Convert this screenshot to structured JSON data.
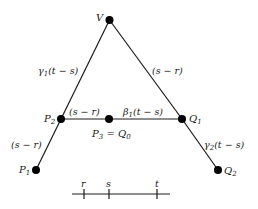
{
  "diagram": {
    "type": "graph",
    "nodes": {
      "V": {
        "label": "V",
        "x": 109.5,
        "y": 20
      },
      "P2": {
        "label": "P",
        "sub": "2",
        "x": 61,
        "y": 119
      },
      "P3": {
        "label": "P",
        "sub": "3",
        "x": 109,
        "y": 119
      },
      "Q1": {
        "label": "Q",
        "sub": "1",
        "x": 182,
        "y": 119
      },
      "P1": {
        "label": "P",
        "sub": "1",
        "x": 36,
        "y": 170
      },
      "Q2": {
        "label": "Q",
        "sub": "2",
        "x": 218,
        "y": 170
      }
    },
    "p3_label": {
      "left": "P",
      "left_sub": "3",
      "eq": " = ",
      "right": "Q",
      "right_sub": "0"
    },
    "edges": [
      {
        "from": "V",
        "to": "P2",
        "label": "γ",
        "label_sub": "1",
        "label_arg": "(t − s)"
      },
      {
        "from": "V",
        "to": "Q1",
        "label": "(s − r)"
      },
      {
        "from": "P2",
        "to": "P3",
        "label": "(s − r)"
      },
      {
        "from": "P3",
        "to": "Q1",
        "label": "β",
        "label_sub": "1",
        "label_arg": "(t − s)"
      },
      {
        "from": "P2",
        "to": "P1",
        "label": "(s − r)"
      },
      {
        "from": "Q1",
        "to": "Q2",
        "label": "γ",
        "label_sub": "2",
        "label_arg": "(t − s)"
      }
    ],
    "timeline": {
      "ticks": [
        {
          "label": "r",
          "x": 84
        },
        {
          "label": "s",
          "x": 109
        },
        {
          "label": "t",
          "x": 157
        }
      ]
    }
  }
}
